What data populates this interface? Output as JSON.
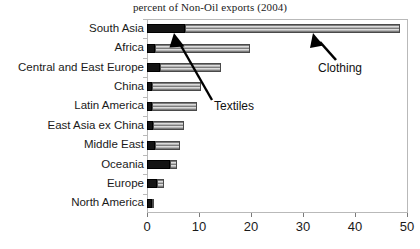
{
  "chart_data": {
    "type": "bar",
    "orientation": "horizontal",
    "stacked": true,
    "title": "percent of Non-Oil exports (2004)",
    "xlabel": "",
    "ylabel": "",
    "xlim": [
      0,
      50
    ],
    "xticks": [
      0,
      10,
      20,
      30,
      40,
      50
    ],
    "grid": false,
    "legend": "none (series identified by arrow annotations)",
    "categories": [
      "South Asia",
      "Africa",
      "Central and East Europe",
      "China",
      "Latin America",
      "East Asia ex China",
      "Middle East",
      "Oceania",
      "Europe",
      "North America"
    ],
    "series": [
      {
        "name": "Textiles",
        "color": "#141414",
        "values": [
          7.3,
          1.5,
          2.5,
          1.0,
          1.0,
          1.2,
          1.5,
          4.4,
          1.9,
          0.9
        ]
      },
      {
        "name": "Clothing",
        "color": "#d2d2d2",
        "values": [
          41.3,
          18.3,
          11.7,
          9.4,
          8.6,
          5.9,
          4.8,
          1.4,
          1.4,
          0.4
        ]
      }
    ],
    "totals": [
      48.6,
      19.8,
      14.2,
      10.4,
      9.6,
      7.1,
      6.3,
      5.8,
      3.3,
      1.3
    ],
    "annotations": [
      {
        "label": "Textiles",
        "points_to": "South Asia textiles segment",
        "arrow": "up-left"
      },
      {
        "label": "Clothing",
        "points_to": "South Asia clothing segment",
        "arrow": "up-left"
      }
    ]
  },
  "axis": {
    "tick_labels": [
      "0",
      "10",
      "20",
      "30",
      "40",
      "50"
    ]
  },
  "annotations": {
    "textiles_label": "Textiles",
    "clothing_label": "Clothing"
  },
  "colors": {
    "textiles": "#141414",
    "clothing": "#d2d2d2",
    "frame": "#b9b9b9",
    "text": "#1a1a1a"
  }
}
